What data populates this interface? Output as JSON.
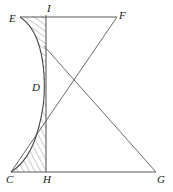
{
  "figure": {
    "type": "geometry-diagram",
    "title": "",
    "stroke_color": "#5a5a5a",
    "label_color": "#1a1a1a",
    "hatch_color": "#6b6b6b",
    "background": "#ffffff",
    "width": 173,
    "height": 192
  },
  "labels": [
    {
      "id": "E",
      "text": "E",
      "x": 9,
      "y": 13
    },
    {
      "id": "I",
      "text": "I",
      "x": 47,
      "y": 4
    },
    {
      "id": "F",
      "text": "F",
      "x": 119,
      "y": 10
    },
    {
      "id": "D",
      "text": "D",
      "x": 32,
      "y": 82
    },
    {
      "id": "C",
      "text": "C",
      "x": 6,
      "y": 174
    },
    {
      "id": "H",
      "text": "H",
      "x": 43,
      "y": 174
    },
    {
      "id": "G",
      "text": "G",
      "x": 157,
      "y": 174
    }
  ],
  "points": {
    "E": {
      "x": 20,
      "y": 17
    },
    "I": {
      "x": 46,
      "y": 15
    },
    "F": {
      "x": 117,
      "y": 17
    },
    "D": {
      "x": 44,
      "y": 88
    },
    "C": {
      "x": 11,
      "y": 172
    },
    "H": {
      "x": 46,
      "y": 172
    },
    "G": {
      "x": 156,
      "y": 172
    },
    "X": {
      "x": 78,
      "y": 80
    },
    "P": {
      "x": 44,
      "y": 46
    },
    "Q": {
      "x": 45,
      "y": 126
    }
  },
  "segments": [
    {
      "id": "top-edge",
      "name": "segment-E-F",
      "from": "E",
      "to": "F"
    },
    {
      "id": "bottom-edge",
      "name": "segment-C-G",
      "from": "C",
      "to": "G"
    },
    {
      "id": "vertical-axis",
      "name": "segment-I-H",
      "from": "I",
      "to": "H"
    },
    {
      "id": "diagonal-to-G",
      "name": "segment-P-G",
      "from": "P",
      "to": "G"
    },
    {
      "id": "diagonal-C-to-F",
      "name": "segment-C-F",
      "from": "C",
      "to": "F"
    }
  ],
  "curve": {
    "name": "curve-E-D-C",
    "description": "hyperbola-like curve from E through D to C",
    "path": "M 20 17 C 34 26, 42 46, 44 74 C 45 95, 44 108, 38 130 C 32 152, 22 165, 11 172"
  },
  "hatched_regions": [
    {
      "name": "hatch-upper-E-I-D",
      "description": "region between curve E-D and vertical line I-D, hatched with diagonal lines",
      "path": "M 20 17 L 46 15 L 46 88 L 44 88 C 42 46, 34 26, 20 17 Z"
    },
    {
      "name": "hatch-lower-D-C-H",
      "description": "region between curve D-C and vertical line D-H, hatched with diagonal lines",
      "path": "M 44 88 L 46 88 L 46 172 L 11 172 C 22 165, 32 152, 38 130 C 44 108, 45 95, 44 88 Z"
    }
  ]
}
